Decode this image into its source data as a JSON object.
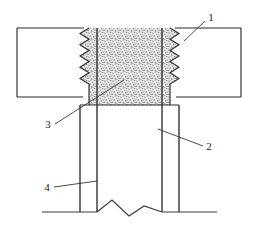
{
  "figure": {
    "type": "patent-line-drawing",
    "background_color": "#ffffff",
    "line_color": "#2b2b2b",
    "text_color": "#1a1a1a",
    "stipple_color": "#555555",
    "stipple_fill": "#e8e8e8",
    "canvas": {
      "width": 256,
      "height": 226
    }
  },
  "reference_numbers": [
    {
      "id": "ref-1",
      "label": "1",
      "text_x": 211,
      "text_y": 21,
      "leader": {
        "x1": 205,
        "y1": 21,
        "x2": 184,
        "y2": 41
      },
      "describes": "external thread crest on right side of shank"
    },
    {
      "id": "ref-2",
      "label": "2",
      "text_x": 207,
      "text_y": 150,
      "leader": {
        "x1": 203,
        "y1": 146,
        "x2": 158,
        "y2": 129
      },
      "describes": "shank body below plate"
    },
    {
      "id": "ref-3",
      "label": "3",
      "text_x": 46,
      "text_y": 128,
      "leader": {
        "x1": 55,
        "y1": 124,
        "x2": 124,
        "y2": 80
      },
      "describes": "threaded engagement region in plate"
    },
    {
      "id": "ref-4",
      "label": "4",
      "text_x": 45,
      "text_y": 191,
      "leader": {
        "x1": 54,
        "y1": 187,
        "x2": 97,
        "y2": 181
      },
      "describes": "inner bore wall of shank"
    }
  ],
  "geometry": {
    "plate": {
      "name": "horizontal plate",
      "x": 17,
      "y": 28,
      "width": 224,
      "height": 69
    },
    "threaded_zone": {
      "name": "stippled threaded region",
      "x": 80,
      "y": 28,
      "width": 99,
      "height": 77,
      "tooth_count": 8,
      "tooth_depth": 9
    },
    "vertical_lines": [
      {
        "name": "outer-left-shank-line",
        "x": 80,
        "y1": 105,
        "y2": 212
      },
      {
        "name": "inner-left-bore-line",
        "x": 97,
        "y1": 28,
        "y2": 212
      },
      {
        "name": "inner-right-bore-line",
        "x": 162,
        "y1": 28,
        "y2": 212
      },
      {
        "name": "outer-right-shank-line",
        "x": 179,
        "y1": 105,
        "y2": 212
      }
    ],
    "baseline": {
      "name": "ground baseline",
      "x1": 42,
      "y1": 212,
      "x2": 217,
      "y2": 212
    },
    "break_symbol": {
      "name": "break line zigzag",
      "points": "97,212 112,200 129,216 144,206 162,212"
    }
  }
}
